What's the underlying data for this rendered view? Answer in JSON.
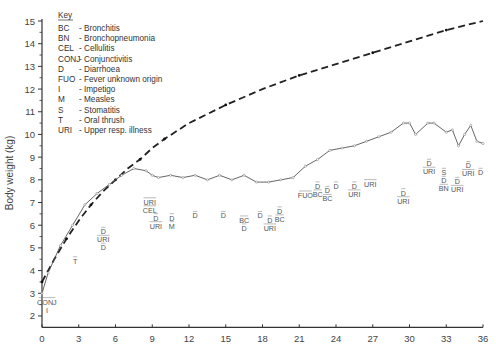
{
  "chart_data": {
    "type": "line",
    "title": "",
    "xlabel": "",
    "ylabel": "Body weight (kg)",
    "xlim": [
      0,
      36
    ],
    "ylim": [
      1.5,
      15
    ],
    "x_ticks": [
      0,
      3,
      6,
      9,
      12,
      15,
      18,
      21,
      24,
      27,
      30,
      33,
      36
    ],
    "y_ticks": [
      2,
      3,
      4,
      5,
      6,
      7,
      8,
      9,
      10,
      11,
      12,
      13,
      14,
      15
    ],
    "grid": false,
    "values_are_estimates": true,
    "estimate_precision": "approx. ±0.2 kg, ±0.5 month (read from pixel position; no data labels or gridlines in source)",
    "legend": {
      "position": "top-left",
      "title": "Key",
      "entries": [
        {
          "abbr": "BC",
          "meaning": "Bronchitis"
        },
        {
          "abbr": "BN",
          "meaning": "Bronchopneumonia"
        },
        {
          "abbr": "CEL",
          "meaning": "Cellulitis"
        },
        {
          "abbr": "CONJ",
          "meaning": "Conjunctivitis"
        },
        {
          "abbr": "D",
          "meaning": "Diarrhoea"
        },
        {
          "abbr": "FUO",
          "meaning": "Fever unknown origin"
        },
        {
          "abbr": "I",
          "meaning": "Impetigo"
        },
        {
          "abbr": "M",
          "meaning": "Measles"
        },
        {
          "abbr": "S",
          "meaning": "Stomatitis"
        },
        {
          "abbr": "T",
          "meaning": "Oral thrush"
        },
        {
          "abbr": "URI",
          "meaning": "Upper resp. illness"
        }
      ]
    },
    "series": [
      {
        "name": "Reference weight curve",
        "style": "dashed, solid dot markers",
        "x": [
          0,
          1,
          2,
          3,
          4,
          5,
          6,
          7,
          8,
          9,
          10,
          12,
          15,
          18,
          21,
          24,
          27,
          30,
          33,
          36
        ],
        "y": [
          3.5,
          4.5,
          5.4,
          6.2,
          6.9,
          7.5,
          8.0,
          8.5,
          8.9,
          9.4,
          9.8,
          10.5,
          11.3,
          12.0,
          12.6,
          13.1,
          13.6,
          14.1,
          14.6,
          15.0
        ]
      },
      {
        "name": "Observed child weight",
        "style": "thin solid line, open circle markers",
        "x": [
          0,
          0.5,
          1.5,
          2.5,
          3.5,
          4.5,
          5.5,
          6.5,
          7.5,
          8.5,
          9,
          9.5,
          10.5,
          11.5,
          12.5,
          13.5,
          14.5,
          15.5,
          16.5,
          17.5,
          18.5,
          19.5,
          20.5,
          21.5,
          22.5,
          23.5,
          24.5,
          25.5,
          26.5,
          27.5,
          28.5,
          29.5,
          30,
          30.5,
          31.5,
          32,
          33,
          33.5,
          34,
          34.5,
          35,
          35.5,
          36
        ],
        "y": [
          3.0,
          3.9,
          5.1,
          6.0,
          6.9,
          7.4,
          7.8,
          8.2,
          8.5,
          8.4,
          8.2,
          8.1,
          8.2,
          8.1,
          8.2,
          8.0,
          8.2,
          8.0,
          8.2,
          7.9,
          7.9,
          8.0,
          8.1,
          8.6,
          8.9,
          9.3,
          9.4,
          9.5,
          9.7,
          9.9,
          10.1,
          10.5,
          10.5,
          10.0,
          10.5,
          10.5,
          10.1,
          10.2,
          9.5,
          10.0,
          10.4,
          9.7,
          9.6
        ]
      }
    ],
    "annotations": [
      {
        "text": "CONJ",
        "x": 0.4,
        "y": 2.5,
        "note": "with 'I' beneath"
      },
      {
        "text": "T",
        "x": 2.7,
        "y": 4.3,
        "note": "overlined"
      },
      {
        "text": "D / URI / D",
        "x": 5.0,
        "y": 5.6,
        "note": "stacked, overlined"
      },
      {
        "text": "URI / CEL",
        "x": 8.8,
        "y": 6.9
      },
      {
        "text": "D / URI",
        "x": 9.3,
        "y": 6.2
      },
      {
        "text": "D / M",
        "x": 10.6,
        "y": 6.2
      },
      {
        "text": "D",
        "x": 12.5,
        "y": 6.3
      },
      {
        "text": "D",
        "x": 14.8,
        "y": 6.3
      },
      {
        "text": "BC / D",
        "x": 16.5,
        "y": 6.1
      },
      {
        "text": "D",
        "x": 17.8,
        "y": 6.3
      },
      {
        "text": "D / URI",
        "x": 18.6,
        "y": 6.1
      },
      {
        "text": "D / BC",
        "x": 19.4,
        "y": 6.5
      },
      {
        "text": "FUO",
        "x": 21.5,
        "y": 7.2
      },
      {
        "text": "D / BC",
        "x": 22.5,
        "y": 7.6
      },
      {
        "text": "D / BC",
        "x": 23.3,
        "y": 7.4
      },
      {
        "text": "D",
        "x": 24.0,
        "y": 7.6
      },
      {
        "text": "D / URI",
        "x": 25.5,
        "y": 7.6
      },
      {
        "text": "URI",
        "x": 26.8,
        "y": 7.7
      },
      {
        "text": "D / URI",
        "x": 29.5,
        "y": 7.3
      },
      {
        "text": "D / URI",
        "x": 31.6,
        "y": 8.6
      },
      {
        "text": "S / D / BN",
        "x": 32.8,
        "y": 8.2
      },
      {
        "text": "D / URI",
        "x": 34.8,
        "y": 8.5
      },
      {
        "text": "D / URI",
        "x": 33.9,
        "y": 7.8
      },
      {
        "text": "D",
        "x": 35.8,
        "y": 8.2
      }
    ]
  }
}
